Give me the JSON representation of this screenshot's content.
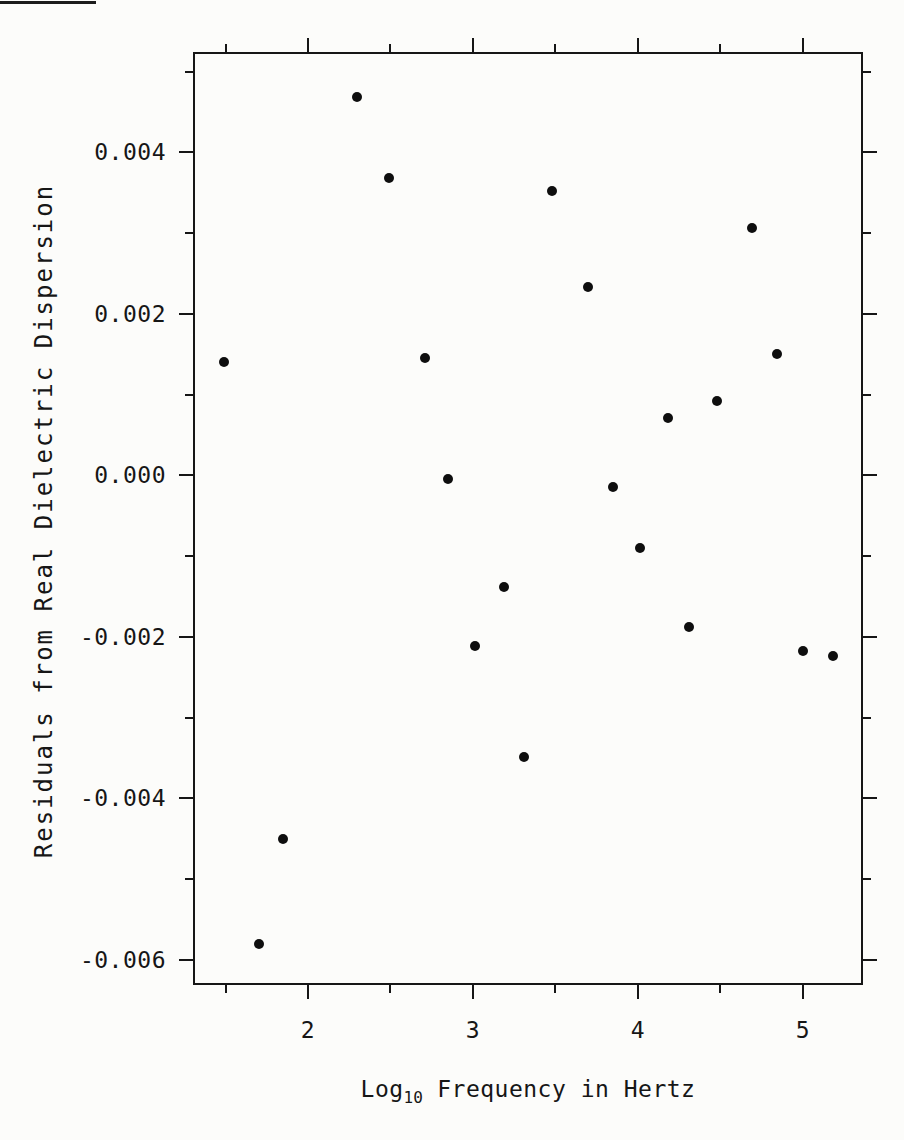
{
  "figure": {
    "background": "#fcfcfa",
    "ink": "#161616",
    "point_color": "#0e0e0e"
  },
  "chart_data": {
    "type": "scatter",
    "title": "",
    "xlabel": {
      "pre": "Log",
      "sub": "10",
      "post": " Frequency in Hertz"
    },
    "ylabel": "Residuals from Real Dielectric Dispersion",
    "xlim": [
      1.309,
      5.358
    ],
    "ylim": [
      -0.0063,
      0.00523
    ],
    "grid": false,
    "legend": null,
    "marker": "filled-circle",
    "x_ticks": {
      "major": [
        {
          "value": 2,
          "label": "2"
        },
        {
          "value": 3,
          "label": "3"
        },
        {
          "value": 4,
          "label": "4"
        },
        {
          "value": 5,
          "label": "5"
        }
      ],
      "minor": [
        1.5,
        2.5,
        3.5,
        4.5
      ]
    },
    "y_ticks": {
      "major": [
        {
          "value": 0.004,
          "label": "0.004"
        },
        {
          "value": 0.002,
          "label": "0.002"
        },
        {
          "value": 0.0,
          "label": "0.000"
        },
        {
          "value": -0.002,
          "label": "-0.002"
        },
        {
          "value": -0.004,
          "label": "-0.004"
        },
        {
          "value": -0.006,
          "label": "-0.006"
        }
      ],
      "minor": [
        0.005,
        0.003,
        0.001,
        -0.001,
        -0.003,
        -0.005
      ]
    },
    "points": [
      [
        1.49,
        0.0014
      ],
      [
        1.7,
        -0.0058
      ],
      [
        1.85,
        -0.00451
      ],
      [
        2.3,
        0.00469
      ],
      [
        2.49,
        0.00368
      ],
      [
        2.71,
        0.00145
      ],
      [
        2.85,
        -4e-05
      ],
      [
        3.01,
        -0.00211
      ],
      [
        3.19,
        -0.00138
      ],
      [
        3.31,
        -0.00349
      ],
      [
        3.48,
        0.00352
      ],
      [
        3.7,
        0.00233
      ],
      [
        3.85,
        -0.00014
      ],
      [
        4.01,
        -0.0009
      ],
      [
        4.18,
        0.00071
      ],
      [
        4.31,
        -0.00188
      ],
      [
        4.48,
        0.00092
      ],
      [
        4.69,
        0.00306
      ],
      [
        4.84,
        0.0015
      ],
      [
        5.0,
        -0.00217
      ],
      [
        5.18,
        -0.00224
      ]
    ]
  }
}
